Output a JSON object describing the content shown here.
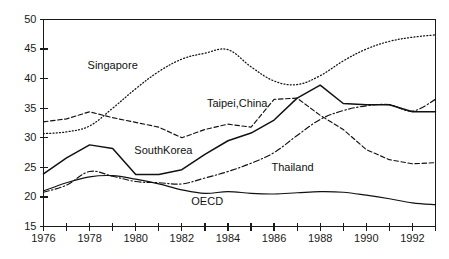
{
  "chart_data": {
    "type": "line",
    "title": "",
    "subtitle": "",
    "xlabel": "",
    "ylabel": "",
    "xlim": [
      1976,
      1993
    ],
    "ylim": [
      15,
      50
    ],
    "grid": false,
    "legend_position": "inline-annotations",
    "y_ticks": [
      15,
      20,
      25,
      30,
      35,
      40,
      45,
      50
    ],
    "y_tick_labels": [
      "15",
      "20",
      "25",
      "30",
      "35",
      "40",
      "45",
      "50"
    ],
    "x_ticks": [
      1976,
      1977,
      1978,
      1979,
      1980,
      1981,
      1982,
      1983,
      1984,
      1985,
      1986,
      1987,
      1988,
      1989,
      1990,
      1991,
      1992,
      1993
    ],
    "x_tick_labels": [
      "1976",
      "",
      "1978",
      "",
      "1980",
      "",
      "1982",
      "",
      "1984",
      "",
      "1986",
      "",
      "1988",
      "",
      "1990",
      "",
      "1992",
      ""
    ],
    "x_labeled_ticks": [
      {
        "year": 1976,
        "label": "1976"
      },
      {
        "year": 1978,
        "label": "1978"
      },
      {
        "year": 1980,
        "label": "1980"
      },
      {
        "year": 1982,
        "label": "1982"
      },
      {
        "year": 1984,
        "label": "1984"
      },
      {
        "year": 1986,
        "label": "1986"
      },
      {
        "year": 1988,
        "label": "1988"
      },
      {
        "year": 1990,
        "label": "1990"
      },
      {
        "year": 1992,
        "label": "1992"
      }
    ],
    "x": [
      1976,
      1977,
      1978,
      1979,
      1980,
      1981,
      1982,
      1983,
      1984,
      1985,
      1986,
      1987,
      1988,
      1989,
      1990,
      1991,
      1992,
      1993
    ],
    "series": [
      {
        "name": "Singapore",
        "style": "dotted",
        "color": "#111111",
        "label_x": 1979.0,
        "label_y": 42.2,
        "values": [
          30.7,
          31.0,
          32.0,
          35.0,
          38.3,
          41.2,
          43.3,
          44.3,
          44.9,
          42.0,
          39.6,
          39.0,
          40.5,
          43.0,
          45.0,
          46.3,
          47.0,
          47.4
        ]
      },
      {
        "name": "Taipei,China",
        "style": "dashed",
        "color": "#111111",
        "label_x": 1984.4,
        "label_y": 35.7,
        "values": [
          32.7,
          33.2,
          34.4,
          33.4,
          32.6,
          31.8,
          30.0,
          31.4,
          32.3,
          31.8,
          36.5,
          36.7,
          33.8,
          31.4,
          28.0,
          26.3,
          25.6,
          25.8
        ]
      },
      {
        "name": "SouthKorea",
        "style": "solid",
        "color": "#111111",
        "label_x": 1981.2,
        "label_y": 27.8,
        "values": [
          23.9,
          26.6,
          28.8,
          28.2,
          23.8,
          23.8,
          24.6,
          27.2,
          29.5,
          30.8,
          33.0,
          36.7,
          38.9,
          35.8,
          35.6,
          35.6,
          34.4,
          34.4
        ]
      },
      {
        "name": "Thailand",
        "style": "dashdot",
        "color": "#111111",
        "label_x": 1986.8,
        "label_y": 24.8,
        "values": [
          20.8,
          22.0,
          24.3,
          23.5,
          22.6,
          22.4,
          22.2,
          23.2,
          24.3,
          25.7,
          27.5,
          30.4,
          33.1,
          34.6,
          35.4,
          35.6,
          34.5,
          36.5
        ]
      },
      {
        "name": "OECD",
        "style": "solid-thin",
        "color": "#111111",
        "label_x": 1983.1,
        "label_y": 19.1,
        "values": [
          21.0,
          22.4,
          23.4,
          23.6,
          23.0,
          22.2,
          21.2,
          20.6,
          20.9,
          20.6,
          20.5,
          20.7,
          20.9,
          20.8,
          20.3,
          19.7,
          19.0,
          18.7
        ]
      }
    ]
  }
}
